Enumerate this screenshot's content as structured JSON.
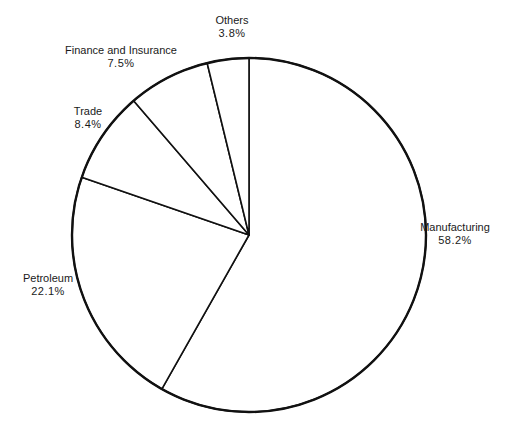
{
  "chart_data": {
    "type": "pie",
    "title": "",
    "start_angle_deg": 0,
    "direction": "clockwise",
    "slices": [
      {
        "label": "Manufacturing",
        "value": 58.2,
        "display": "58.2%",
        "label_pos": [
          455,
          234
        ]
      },
      {
        "label": "Petroleum",
        "value": 22.1,
        "display": "22.1%",
        "label_pos": [
          48,
          285
        ]
      },
      {
        "label": "Trade",
        "value": 8.4,
        "display": "8.4%",
        "label_pos": [
          88,
          118
        ]
      },
      {
        "label": "Finance and Insurance",
        "value": 7.5,
        "display": "7.5%",
        "label_pos": [
          121,
          57
        ]
      },
      {
        "label": "Others",
        "value": 3.8,
        "display": "3.8%",
        "label_pos": [
          232,
          27
        ]
      }
    ],
    "geometry": {
      "cx": 249,
      "cy": 235,
      "r": 177
    },
    "colors": {
      "fill": "#ffffff",
      "stroke": "#111111"
    }
  }
}
